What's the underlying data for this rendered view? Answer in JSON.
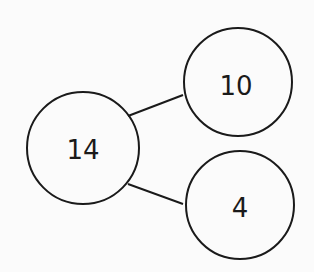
{
  "diagram": {
    "type": "number-bond",
    "whole": "14",
    "parts": [
      "10",
      "4"
    ],
    "stroke_color": "#1a1a1a",
    "background": "#fbfbfb"
  }
}
